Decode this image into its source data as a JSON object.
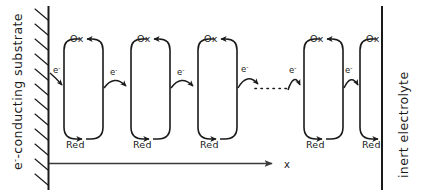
{
  "diagram": {
    "left_boundary_label": "e--conducting substrate",
    "left_boundary_label_prefix": "e",
    "left_boundary_label_sup": "-",
    "left_boundary_label_rest": "-conducting substrate",
    "right_boundary_label": "inert electrolyte",
    "axis_label": "x",
    "species_oxidized": "Ox",
    "species_reduced": "Red",
    "electron_label": "e",
    "electron_superscript": "-",
    "colors": {
      "ink": "#1a1a1a",
      "background": "#ffffff",
      "axis": "#3a3a3a"
    },
    "redox_units": [
      {
        "id": "unit-1",
        "ox_label": "Ox",
        "red_label": "Red",
        "clipped": false
      },
      {
        "id": "unit-2",
        "ox_label": "Ox",
        "red_label": "Red",
        "clipped": false
      },
      {
        "id": "unit-3",
        "ox_label": "Ox",
        "red_label": "Red",
        "clipped": false
      },
      {
        "id": "unit-4",
        "ox_label": "Ox",
        "red_label": "Red",
        "clipped": false
      },
      {
        "id": "unit-5",
        "ox_label": "Ox",
        "red_label": "Red",
        "clipped": true
      }
    ],
    "electron_hops": [
      {
        "id": "hop-0",
        "label": "e-",
        "from": "substrate",
        "to": "unit-1"
      },
      {
        "id": "hop-1",
        "label": "e-",
        "from": "unit-1",
        "to": "unit-2"
      },
      {
        "id": "hop-2",
        "label": "e-",
        "from": "unit-2",
        "to": "unit-3"
      },
      {
        "id": "hop-3",
        "label": "e-",
        "from": "unit-3",
        "to": "ellipsis"
      },
      {
        "id": "hop-4",
        "label": "e-",
        "from": "ellipsis",
        "to": "unit-4"
      },
      {
        "id": "hop-5",
        "label": "e-",
        "from": "unit-4",
        "to": "unit-5"
      }
    ],
    "continuation_marker": "dotted-ellipsis"
  }
}
